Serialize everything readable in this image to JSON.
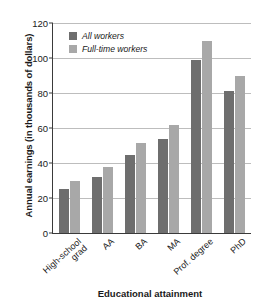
{
  "chart_data": {
    "type": "bar",
    "title": "",
    "xlabel": "Educational attainment",
    "ylabel": "Annual earnings (in thousands of dollars)",
    "categories": [
      "High-school\ngrad",
      "AA",
      "BA",
      "MA",
      "Prof. degree",
      "PhD"
    ],
    "series": [
      {
        "name": "All workers",
        "color": "#6e6e6e",
        "values": [
          25,
          32,
          44.5,
          54,
          99,
          81
        ]
      },
      {
        "name": "Full-time workers",
        "color": "#a8a8a8",
        "values": [
          30,
          37.5,
          51.5,
          62,
          109.5,
          90
        ]
      }
    ],
    "ylim": [
      0,
      120
    ],
    "yticks": [
      0,
      20,
      40,
      60,
      80,
      100,
      120
    ],
    "ytick_labels": [
      "0",
      "20",
      "40",
      "60",
      "80",
      "100",
      "120"
    ],
    "grid": true,
    "legend_position": "top-left"
  }
}
